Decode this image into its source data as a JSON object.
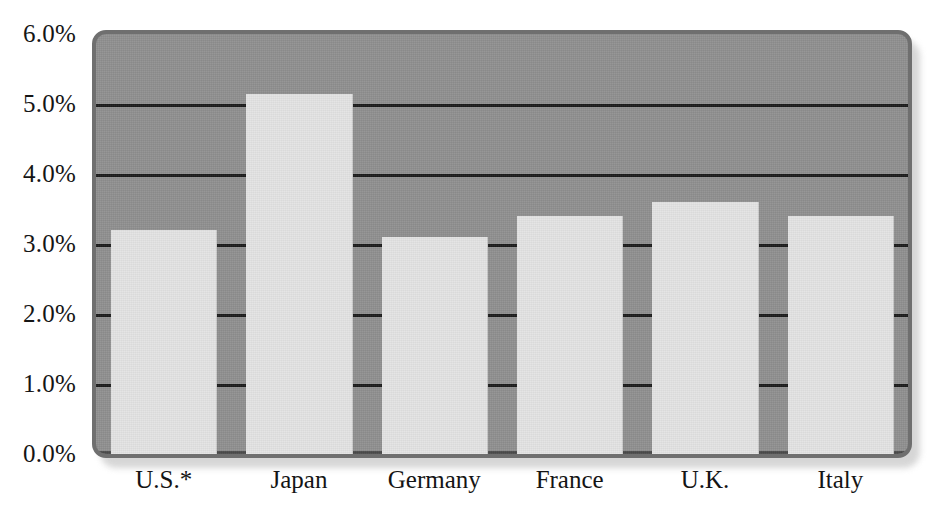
{
  "chart_data": {
    "type": "bar",
    "title": "",
    "subtitle": "",
    "xlabel": "",
    "ylabel": "",
    "categories": [
      "U.S.*",
      "Japan",
      "Germany",
      "France",
      "U.K.",
      "Italy"
    ],
    "values": [
      3.2,
      5.15,
      3.1,
      3.4,
      3.6,
      3.4
    ],
    "series": [
      {
        "name": "",
        "values": [
          3.2,
          5.15,
          3.1,
          3.4,
          3.6,
          3.4
        ]
      }
    ],
    "ylim": [
      0.0,
      6.0
    ],
    "ytick_values": [
      0.0,
      1.0,
      2.0,
      3.0,
      4.0,
      5.0,
      6.0
    ],
    "ytick_labels": [
      "0.0%",
      "1.0%",
      "2.0%",
      "3.0%",
      "4.0%",
      "5.0%",
      "6.0%"
    ],
    "grid": true,
    "grid_axis": "y",
    "legend": false,
    "legend_position": "none",
    "annotations": [],
    "value_format": "percent",
    "bar_color": "#e3e3e3",
    "plot_background": "#8f8f8f",
    "gridline_color": "#1b1b1b",
    "text_color": "#141414",
    "page_background": "#ffffff"
  }
}
